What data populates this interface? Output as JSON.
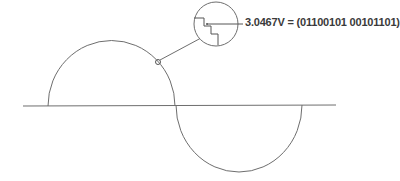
{
  "diagram": {
    "annotation": {
      "label": "3.0467V = (01100101 00101101)",
      "voltage": "3.0467V",
      "binary_code": "01100101 00101101"
    },
    "elements": {
      "baseline": "time axis",
      "waveform": "sine wave (one period)",
      "sample_point": "sampled point on waveform",
      "magnifier": "zoomed staircase (quantized step) view"
    },
    "colors": {
      "stroke": "#6e6e6e",
      "text": "#3a3a3a",
      "background": "#ffffff"
    }
  }
}
